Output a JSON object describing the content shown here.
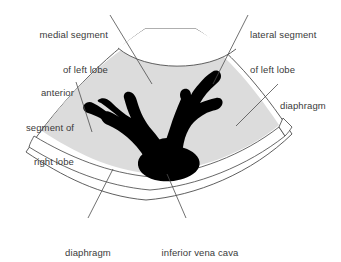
{
  "figure": {
    "name": "ultrasound-liver-sector-diagram",
    "background_color": "#ffffff",
    "liver_fill_color": "#dcdcdc",
    "vessel_fill_color": "#000000",
    "outline_color": "#4d4d4d",
    "text_color": "#3a3a3a"
  },
  "labels": [
    {
      "id": "medial-segment-left-lobe",
      "lines": [
        "medial segment",
        "of left lobe"
      ],
      "align": "right",
      "x": 12,
      "y": 6,
      "width": 96
    },
    {
      "id": "lateral-segment-left-lobe",
      "lines": [
        "lateral segment",
        "of left lobe"
      ],
      "align": "left",
      "x": 250,
      "y": 6,
      "width": 92
    },
    {
      "id": "anterior-segment-right-lobe",
      "lines": [
        "anterior",
        "segment of",
        "right lobe"
      ],
      "align": "right",
      "x": 8,
      "y": 64,
      "width": 66
    },
    {
      "id": "diaphragm-right",
      "lines": [
        "diaphragm"
      ],
      "align": "left",
      "x": 280,
      "y": 77,
      "width": 60
    },
    {
      "id": "diaphragm-bottom",
      "lines": [
        "diaphragm"
      ],
      "align": "center",
      "x": 55,
      "y": 224,
      "width": 66
    },
    {
      "id": "inferior-vena-cava",
      "lines": [
        "inferior vena cava"
      ],
      "align": "center",
      "x": 148,
      "y": 224,
      "width": 104
    }
  ],
  "structures": [
    {
      "id": "liver-parenchyma",
      "name": "liver parenchyma",
      "fill": "#dcdcdc"
    },
    {
      "id": "diaphragm-band",
      "name": "diaphragm",
      "fill": "#ffffff"
    },
    {
      "id": "hepatic-veins",
      "name": "hepatic veins",
      "fill": "#000000"
    },
    {
      "id": "inferior-vena-cava-lumen",
      "name": "inferior vena cava",
      "fill": "#000000"
    },
    {
      "id": "sector-field",
      "name": "ultrasound sector field",
      "fill": "#ffffff"
    }
  ],
  "leader_lines": [
    {
      "id": "leader-medial-segment",
      "from_label": "medial-segment-left-lobe",
      "x1": 110,
      "y1": 15,
      "x2": 152,
      "y2": 84
    },
    {
      "id": "leader-lateral-segment",
      "from_label": "lateral-segment-left-lobe",
      "x1": 248,
      "y1": 15,
      "x2": 213,
      "y2": 84
    },
    {
      "id": "leader-anterior-segment",
      "from_label": "anterior-segment-right-lobe",
      "x1": 76,
      "y1": 82,
      "x2": 92,
      "y2": 130
    },
    {
      "id": "leader-diaphragm-right",
      "from_label": "diaphragm-right",
      "x1": 278,
      "y1": 84,
      "x2": 238,
      "y2": 124
    },
    {
      "id": "leader-diaphragm-bottom",
      "from_label": "diaphragm-bottom",
      "x1": 88,
      "y1": 218,
      "x2": 113,
      "y2": 169
    },
    {
      "id": "leader-inferior-vena-cava",
      "from_label": "inferior-vena-cava",
      "x1": 186,
      "y1": 218,
      "x2": 166,
      "y2": 174
    }
  ]
}
